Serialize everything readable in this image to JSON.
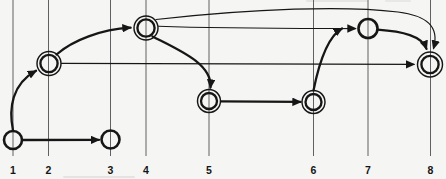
{
  "figure": {
    "kind": "directed-graph-scan",
    "background": "#f5f5f3",
    "ink": "#161616",
    "grid_color": "#585858",
    "canvas": {
      "width": 446,
      "height": 179
    },
    "gridline_top": 0,
    "gridline_bottom": 156,
    "label_baseline_y": 174,
    "positions": [
      {
        "text": "1",
        "x": 13
      },
      {
        "text": "2",
        "x": 48.5
      },
      {
        "text": "3",
        "x": 110.5
      },
      {
        "text": "4",
        "x": 146
      },
      {
        "text": "5",
        "x": 209
      },
      {
        "text": "6",
        "x": 313.5
      },
      {
        "text": "7",
        "x": 368
      },
      {
        "text": "8",
        "x": 430.5
      }
    ],
    "nodes": [
      {
        "id": "1",
        "x": 13,
        "y": 140,
        "double": false,
        "r": 9
      },
      {
        "id": "2",
        "x": 49,
        "y": 63.5,
        "double": true,
        "r": 12,
        "r_inner": 8.6
      },
      {
        "id": "3",
        "x": 110.5,
        "y": 139.5,
        "double": false,
        "r": 9
      },
      {
        "id": "4",
        "x": 146,
        "y": 28,
        "double": true,
        "r": 12,
        "r_inner": 8.6
      },
      {
        "id": "5",
        "x": 209,
        "y": 101,
        "double": true,
        "r": 11.5,
        "r_inner": 8
      },
      {
        "id": "6",
        "x": 313.5,
        "y": 102,
        "double": true,
        "r": 11.5,
        "r_inner": 8
      },
      {
        "id": "7",
        "x": 368,
        "y": 28.5,
        "double": false,
        "r": 9.5
      },
      {
        "id": "8",
        "x": 430,
        "y": 64.5,
        "double": true,
        "r": 12.5,
        "r_inner": 8.6
      }
    ],
    "edges": [
      {
        "from": "1",
        "to": "3",
        "weight": "thick",
        "path": "M 22.5,140 L 99,139.8"
      },
      {
        "from": "1",
        "to": "2",
        "weight": "thick",
        "path": "M 13,130.5 C 8.5,108 12,84 36,70.8"
      },
      {
        "from": "2",
        "to": "4",
        "weight": "thick",
        "path": "M 56.5,54.5 C 73,40 101,29.5 130.5,27.7"
      },
      {
        "from": "2",
        "to": "8",
        "weight": "thin",
        "path": "M 61.5,63.4 L 414,64.4"
      },
      {
        "from": "4",
        "to": "5",
        "weight": "thick",
        "path": "M 152.5,36.5 C 179,50 212.5,64 210.5,87.5"
      },
      {
        "from": "4",
        "to": "7",
        "weight": "thin",
        "path": "M 158.5,26.2 C 225,28.6 300,28.4 355.5,28.6"
      },
      {
        "from": "4",
        "to": "8",
        "weight": "thin",
        "path": "M 156,19.5 C 255,8.5 345,5.5 398,12 C 426,15.5 440,26 433.5,48.5"
      },
      {
        "from": "5",
        "to": "6",
        "weight": "thick",
        "path": "M 221,101.4 L 300.5,101.9"
      },
      {
        "from": "6",
        "to": "7",
        "weight": "thick",
        "path": "M 313.5,90.5 C 318,68 326,37.5 342,28.5"
      },
      {
        "from": "7",
        "to": "8",
        "weight": "thick",
        "path": "M 377.5,29.7 C 403,31.5 422,36 426.5,48.8"
      }
    ]
  }
}
